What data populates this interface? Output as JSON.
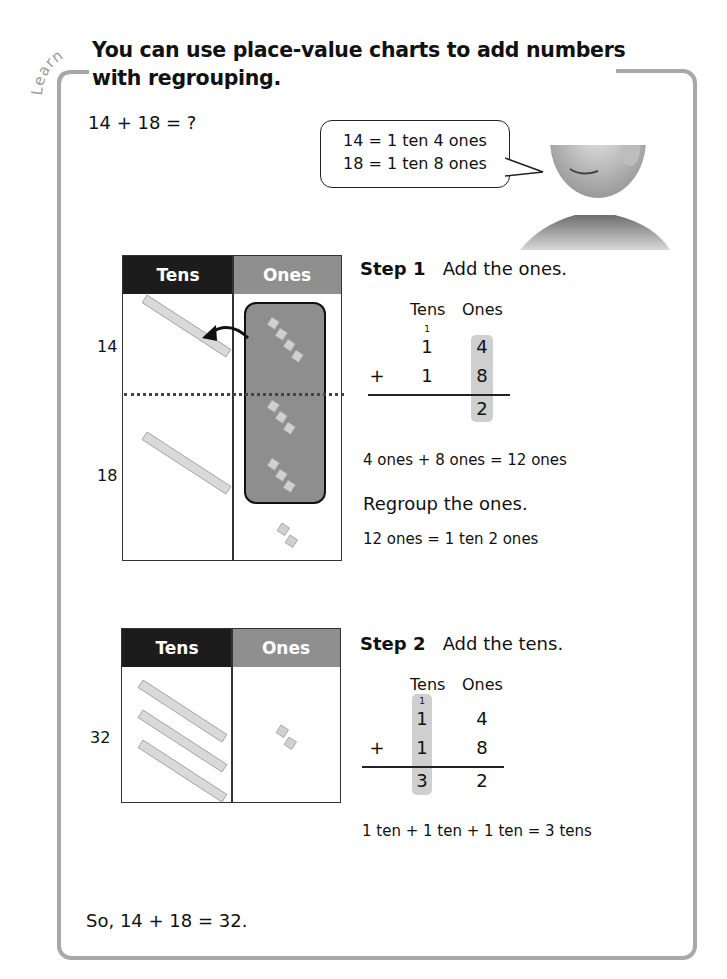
{
  "header": {
    "section_label": "Learn",
    "title_line1": "You can use place-value charts to add numbers",
    "title_line2": "with regrouping."
  },
  "problem": {
    "equation": "14 + 18 = ?"
  },
  "speech_bubble": {
    "line1": "14 = 1 ten 4 ones",
    "line2": "18 = 1 ten 8 ones"
  },
  "chart1": {
    "headers": {
      "tens": "Tens",
      "ones": "Ones"
    },
    "rows": [
      {
        "label": "14",
        "tens_rods": 1,
        "ones_cubes": 4
      },
      {
        "label": "18",
        "tens_rods": 1,
        "ones_cubes": 8
      }
    ],
    "regrouped_cubes": 10,
    "leftover_cubes": 2
  },
  "step1": {
    "label": "Step 1",
    "instruction": "Add the ones.",
    "columns": {
      "tens": "Tens",
      "ones": "Ones"
    },
    "carry": "1",
    "addend1": {
      "tens": "1",
      "ones": "4"
    },
    "addend2": {
      "operator": "+",
      "tens": "1",
      "ones": "8"
    },
    "sum": {
      "tens": "",
      "ones": "2"
    },
    "note1": "4 ones + 8 ones = 12 ones",
    "note2": "Regroup the ones.",
    "note3": "12 ones = 1 ten 2 ones"
  },
  "chart2": {
    "headers": {
      "tens": "Tens",
      "ones": "Ones"
    },
    "row_label": "32",
    "tens_rods": 3,
    "ones_cubes": 2
  },
  "step2": {
    "label": "Step 2",
    "instruction": "Add the tens.",
    "columns": {
      "tens": "Tens",
      "ones": "Ones"
    },
    "carry": "1",
    "addend1": {
      "tens": "1",
      "ones": "4"
    },
    "addend2": {
      "operator": "+",
      "tens": "1",
      "ones": "8"
    },
    "sum": {
      "tens": "3",
      "ones": "2"
    },
    "note1": "1 ten + 1 ten + 1 ten = 3 tens"
  },
  "conclusion": "So, 14 + 18 = 32.",
  "colors": {
    "frame": "#a8a8a8",
    "tens_header": "#1c1c1c",
    "ones_header": "#8f8f8f",
    "highlight": "#cfcfcf",
    "regroup_box": "#8e8e8e"
  }
}
